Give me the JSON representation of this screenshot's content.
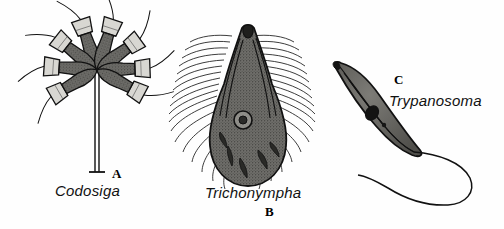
{
  "figure": {
    "background_color": "#fefefe",
    "ink_color": "#1a1a1a",
    "fill_color": "#6b6a66",
    "panels": [
      {
        "letter": "A",
        "genus": "Codosiga",
        "description": "colonial choanoflagellate rosette on a stalk"
      },
      {
        "letter": "B",
        "genus": "Trichonympha",
        "description": "pear-shaped hypermastigote covered in flagella"
      },
      {
        "letter": "C",
        "genus": "Trypanosoma",
        "description": "crescent trypanosome with undulating membrane and flagellum"
      }
    ]
  },
  "panel_a": {
    "genus": "Codosiga",
    "letter": "A"
  },
  "panel_b": {
    "genus": "Trichonympha",
    "letter": "B"
  },
  "panel_c": {
    "genus": "Trypanosoma",
    "letter": "C"
  }
}
